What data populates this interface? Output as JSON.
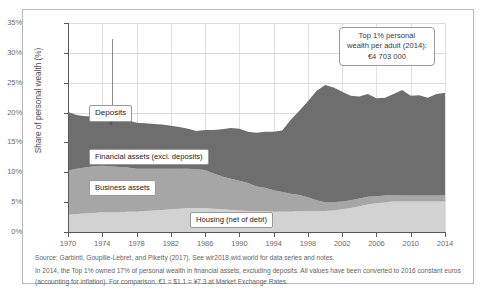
{
  "chart_data": {
    "type": "area",
    "title": "",
    "xlabel": "",
    "ylabel": "Share of personal wealth (%)",
    "xlim": [
      1970,
      2014
    ],
    "ylim": [
      0,
      35
    ],
    "ytick_labels": [
      "0%",
      "5%",
      "10%",
      "15%",
      "20%",
      "25%",
      "30%",
      "35%"
    ],
    "ytick_values": [
      0,
      5,
      10,
      15,
      20,
      25,
      30,
      35
    ],
    "xtick_labels": [
      "1970",
      "1974",
      "1978",
      "1982",
      "1986",
      "1990",
      "1994",
      "1998",
      "2002",
      "2006",
      "2010",
      "2014"
    ],
    "xtick_values": [
      1970,
      1974,
      1978,
      1982,
      1986,
      1990,
      1994,
      1998,
      2002,
      2006,
      2010,
      2014
    ],
    "grid": true,
    "stacked": true,
    "legend_position": "inline-annotations",
    "x": [
      1970,
      1971,
      1972,
      1973,
      1974,
      1975,
      1976,
      1977,
      1978,
      1979,
      1980,
      1981,
      1982,
      1983,
      1984,
      1985,
      1986,
      1987,
      1988,
      1989,
      1990,
      1991,
      1992,
      1993,
      1994,
      1995,
      1996,
      1997,
      1998,
      1999,
      2000,
      2001,
      2002,
      2003,
      2004,
      2005,
      2006,
      2007,
      2008,
      2009,
      2010,
      2011,
      2012,
      2013,
      2014
    ],
    "series": [
      {
        "name": "Housing (net of debt)",
        "color": "#d2d2d2",
        "values": [
          2.9,
          3.0,
          3.1,
          3.2,
          3.3,
          3.3,
          3.3,
          3.4,
          3.4,
          3.5,
          3.6,
          3.7,
          3.8,
          3.9,
          4.0,
          4.0,
          4.0,
          3.9,
          3.8,
          3.7,
          3.6,
          3.5,
          3.5,
          3.5,
          3.4,
          3.4,
          3.4,
          3.5,
          3.5,
          3.5,
          3.5,
          3.6,
          3.8,
          4.0,
          4.3,
          4.6,
          4.8,
          5.0,
          5.1,
          5.1,
          5.1,
          5.1,
          5.1,
          5.1,
          5.1
        ]
      },
      {
        "name": "Business assets",
        "color": "#a6a6a6",
        "values": [
          7.4,
          7.6,
          7.7,
          7.8,
          7.8,
          7.7,
          7.6,
          7.4,
          7.2,
          7.1,
          7.0,
          6.9,
          6.8,
          6.7,
          6.6,
          6.5,
          6.4,
          5.9,
          5.5,
          5.2,
          5.0,
          4.7,
          4.1,
          3.9,
          3.6,
          3.3,
          3.0,
          2.7,
          2.3,
          1.8,
          1.5,
          1.4,
          1.3,
          1.3,
          1.3,
          1.3,
          1.2,
          1.1,
          1.1,
          1.0,
          1.0,
          1.0,
          1.0,
          1.0,
          1.0
        ]
      },
      {
        "name": "Financial assets (excl. deposits)",
        "color": "#6e6e6e",
        "values": [
          9.8,
          9.0,
          8.6,
          8.4,
          8.3,
          8.2,
          8.1,
          7.9,
          7.7,
          7.6,
          7.5,
          7.4,
          7.2,
          7.0,
          6.7,
          6.4,
          6.7,
          7.3,
          7.9,
          8.5,
          8.7,
          8.6,
          9.0,
          9.4,
          9.8,
          10.3,
          12.4,
          14.1,
          16.1,
          18.3,
          19.6,
          19.2,
          18.4,
          17.5,
          17.1,
          17.2,
          16.4,
          16.4,
          16.9,
          17.7,
          16.7,
          16.8,
          16.4,
          17.0,
          17.2
        ]
      }
    ],
    "total_top_boundary_note": "Stack top = total top 1% share of personal wealth; starts ~20.1% in 1970, dips to ~15.7% in 1984, peaks ~28.1% in 2000, ends ~23.3% in 2014",
    "annotations": [
      {
        "name": "deposits-callout",
        "text": "Deposits",
        "target_year": 1973,
        "description": "Points with a leader line and arrow to the thin deposits band at the top of the stack"
      },
      {
        "name": "top-wealth-callout",
        "lines": [
          "Top 1% personal",
          "wealth per adult (2014):",
          "€4 703 000"
        ]
      }
    ]
  },
  "labels": {
    "deposits": "Deposits",
    "financial_assets": "Financial assets (excl. deposits)",
    "business_assets": "Business assets",
    "housing": "Housing (net of debt)"
  },
  "top_wealth_box": {
    "line1": "Top 1% personal",
    "line2": "wealth per adult (2014):",
    "line3": "€4 703 000"
  },
  "footer": {
    "source": "Source: Garbinti, Goupille-Lebret, and Piketty (2017). See wir2018.wid.world for data series and notes.",
    "note": "In 2014, the Top 1% owned 17% of personal wealth in financial assets, excluding deposits. All values have been converted to 2016 constant euros (accounting for inflation). For comparison, €1 = $1.1 = ¥7.3 at Market Exchange Rates."
  }
}
